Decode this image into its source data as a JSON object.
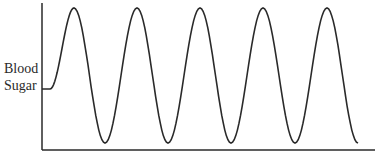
{
  "chart_data": {
    "type": "line",
    "title": "",
    "xlabel": "",
    "ylabel": "Blood Sugar",
    "ylabel_lines": [
      "Blood",
      "Sugar"
    ],
    "grid": false,
    "legend": null,
    "series": [
      {
        "name": "Blood Sugar",
        "description": "Oscillating wave: starts at a mid-low baseline, then rises and falls in 5 large regular cycles",
        "x": [
          0,
          0.5,
          1.5,
          2.5,
          3.5,
          4.5,
          5.5,
          6.5,
          7.5,
          8.5,
          9.5,
          10.5
        ],
        "values": [
          0.4,
          0.4,
          1.0,
          0.0,
          1.0,
          0.0,
          1.0,
          0.0,
          1.0,
          0.0,
          1.0,
          0.0
        ]
      }
    ],
    "color": "#2a2a2a"
  }
}
